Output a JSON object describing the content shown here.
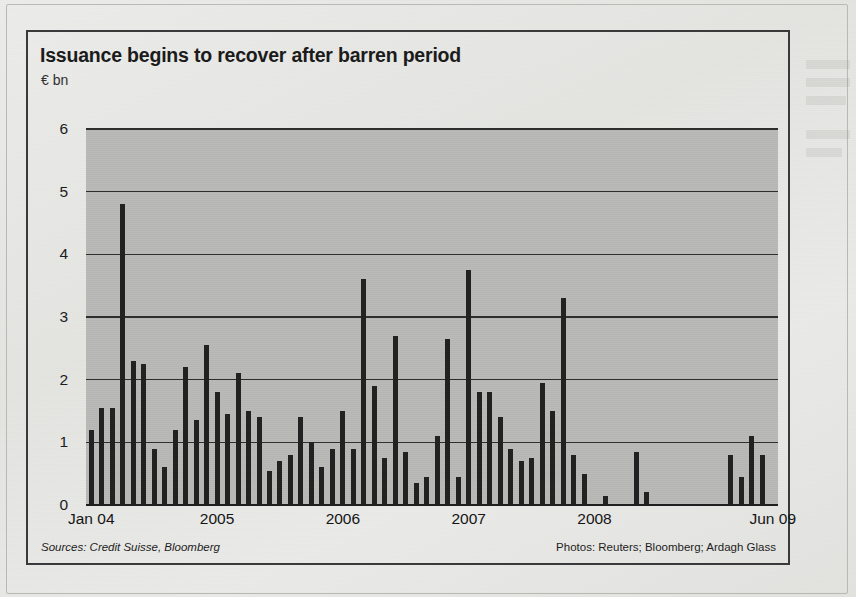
{
  "chart_data": {
    "type": "bar",
    "title": "Issuance begins to recover after barren period",
    "subtitle": "€ bn",
    "ylabel": "€ bn",
    "xlabel": "",
    "ylim": [
      0,
      6
    ],
    "yticks": [
      0,
      1,
      2,
      3,
      4,
      5,
      6
    ],
    "grid": true,
    "legend": false,
    "xtick_labels": [
      "Jan 04",
      "2005",
      "2006",
      "2007",
      "2008",
      "Jun 09"
    ],
    "xtick_positions": [
      0,
      12,
      24,
      36,
      48,
      65
    ],
    "bar_color": "#222222",
    "plot_bgcolor": "#b9b9b7",
    "categories": [
      "Jan 04",
      "Feb 04",
      "Mar 04",
      "Apr 04",
      "May 04",
      "Jun 04",
      "Jul 04",
      "Aug 04",
      "Sep 04",
      "Oct 04",
      "Nov 04",
      "Dec 04",
      "Jan 05",
      "Feb 05",
      "Mar 05",
      "Apr 05",
      "May 05",
      "Jun 05",
      "Jul 05",
      "Aug 05",
      "Sep 05",
      "Oct 05",
      "Nov 05",
      "Dec 05",
      "Jan 06",
      "Feb 06",
      "Mar 06",
      "Apr 06",
      "May 06",
      "Jun 06",
      "Jul 06",
      "Aug 06",
      "Sep 06",
      "Oct 06",
      "Nov 06",
      "Dec 06",
      "Jan 07",
      "Feb 07",
      "Mar 07",
      "Apr 07",
      "May 07",
      "Jun 07",
      "Jul 07",
      "Aug 07",
      "Sep 07",
      "Oct 07",
      "Nov 07",
      "Dec 07",
      "Jan 08",
      "Feb 08",
      "Mar 08",
      "Apr 08",
      "May 08",
      "Jun 08",
      "Jul 08",
      "Aug 08",
      "Sep 08",
      "Oct 08",
      "Nov 08",
      "Dec 08",
      "Jan 09",
      "Feb 09",
      "Mar 09",
      "Apr 09",
      "May 09",
      "Jun 09"
    ],
    "values": [
      1.2,
      1.55,
      1.55,
      4.8,
      2.3,
      2.25,
      0.9,
      0.6,
      1.2,
      2.2,
      1.35,
      2.55,
      1.8,
      1.45,
      2.1,
      1.5,
      1.4,
      0.55,
      0.7,
      0.8,
      1.4,
      1.0,
      0.6,
      0.9,
      1.5,
      0.9,
      3.6,
      1.9,
      0.75,
      2.7,
      0.85,
      0.35,
      0.45,
      1.1,
      2.65,
      0.45,
      3.75,
      1.8,
      1.8,
      1.4,
      0.9,
      0.7,
      0.75,
      1.95,
      1.5,
      3.3,
      0.8,
      0.5,
      0.0,
      0.15,
      0.0,
      0.0,
      0.85,
      0.2,
      0.0,
      0.0,
      0.0,
      0.0,
      0.0,
      0.0,
      0.0,
      0.8,
      0.45,
      1.1,
      0.8,
      0.0
    ],
    "max_value": 4.8,
    "min_value": 0.0
  },
  "footer": {
    "sources": "Sources:  Credit Suisse, Bloomberg",
    "photos": "Photos:  Reuters; Bloomberg; Ardagh Glass"
  }
}
